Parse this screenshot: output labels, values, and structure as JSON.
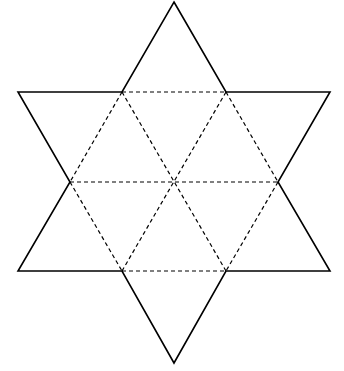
{
  "diagram": {
    "title": "",
    "colors": {
      "background": "#ffffff",
      "stroke": "#000000"
    },
    "outline": {
      "points": [
        [
          174,
          2
        ],
        [
          226,
          92
        ],
        [
          330,
          92
        ],
        [
          278,
          182
        ],
        [
          330,
          271
        ],
        [
          226,
          271
        ],
        [
          174,
          363
        ],
        [
          122,
          271
        ],
        [
          18,
          271
        ],
        [
          70,
          182
        ],
        [
          18,
          92
        ],
        [
          122,
          92
        ]
      ],
      "style": "solid"
    },
    "dashed_lines": [
      {
        "from": [
          122,
          92
        ],
        "to": [
          226,
          92
        ]
      },
      {
        "from": [
          70,
          182
        ],
        "to": [
          278,
          182
        ]
      },
      {
        "from": [
          122,
          271
        ],
        "to": [
          226,
          271
        ]
      },
      {
        "from": [
          122,
          92
        ],
        "to": [
          226,
          271
        ]
      },
      {
        "from": [
          226,
          92
        ],
        "to": [
          122,
          271
        ]
      },
      {
        "from": [
          122,
          92
        ],
        "to": [
          70,
          182
        ]
      },
      {
        "from": [
          70,
          182
        ],
        "to": [
          122,
          271
        ]
      },
      {
        "from": [
          226,
          92
        ],
        "to": [
          278,
          182
        ]
      },
      {
        "from": [
          278,
          182
        ],
        "to": [
          226,
          271
        ]
      }
    ],
    "center": [
      174,
      182
    ]
  }
}
